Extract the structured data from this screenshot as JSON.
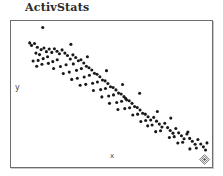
{
  "window": {
    "title": "ActivStats"
  },
  "plot": {
    "y_axis_label": "y",
    "x_axis_label": "x",
    "resize_grip_icon": "diamond-resize-grip-icon",
    "frame_color": "#6d6d6d",
    "point_color": "#1a1a1a",
    "background_color": "#ffffff"
  },
  "chart_data": {
    "type": "scatter",
    "title": "ActivStats",
    "xlabel": "x",
    "ylabel": "y",
    "grid": false,
    "legend": null,
    "xlim": [
      0,
      100
    ],
    "ylim": [
      0,
      100
    ],
    "series": [
      {
        "name": "observations",
        "marker": "dot",
        "color": "#1a1a1a",
        "points": [
          [
            15.8,
            95.5
          ],
          [
            9.3,
            85.0
          ],
          [
            10.2,
            83.3
          ],
          [
            11.7,
            84.6
          ],
          [
            13.1,
            82.0
          ],
          [
            15.0,
            80.4
          ],
          [
            16.4,
            81.5
          ],
          [
            17.6,
            79.0
          ],
          [
            12.4,
            78.0
          ],
          [
            14.2,
            77.0
          ],
          [
            19.0,
            80.8
          ],
          [
            20.3,
            78.5
          ],
          [
            21.6,
            81.0
          ],
          [
            22.9,
            79.3
          ],
          [
            24.1,
            77.6
          ],
          [
            18.2,
            75.5
          ],
          [
            16.0,
            74.2
          ],
          [
            13.5,
            73.0
          ],
          [
            11.0,
            72.6
          ],
          [
            25.4,
            80.2
          ],
          [
            26.8,
            78.0
          ],
          [
            28.1,
            76.4
          ],
          [
            29.5,
            74.0
          ],
          [
            23.0,
            73.5
          ],
          [
            20.8,
            72.2
          ],
          [
            18.6,
            71.0
          ],
          [
            15.4,
            70.4
          ],
          [
            12.8,
            69.0
          ],
          [
            30.8,
            76.8
          ],
          [
            32.2,
            75.0
          ],
          [
            33.5,
            72.8
          ],
          [
            31.0,
            70.6
          ],
          [
            27.4,
            70.0
          ],
          [
            24.6,
            68.8
          ],
          [
            21.2,
            67.5
          ],
          [
            34.8,
            73.5
          ],
          [
            36.2,
            71.2
          ],
          [
            37.5,
            69.0
          ],
          [
            35.0,
            67.4
          ],
          [
            32.6,
            66.2
          ],
          [
            29.0,
            65.0
          ],
          [
            26.0,
            64.0
          ],
          [
            38.8,
            68.0
          ],
          [
            40.2,
            66.4
          ],
          [
            41.5,
            64.2
          ],
          [
            39.0,
            62.8
          ],
          [
            36.4,
            61.6
          ],
          [
            33.0,
            60.8
          ],
          [
            30.2,
            60.0
          ],
          [
            42.8,
            63.5
          ],
          [
            44.2,
            61.8
          ],
          [
            45.5,
            59.6
          ],
          [
            43.0,
            58.2
          ],
          [
            40.6,
            57.4
          ],
          [
            37.2,
            56.6
          ],
          [
            34.4,
            56.0
          ],
          [
            46.8,
            59.0
          ],
          [
            48.2,
            57.2
          ],
          [
            49.5,
            55.0
          ],
          [
            47.0,
            53.8
          ],
          [
            44.6,
            53.0
          ],
          [
            41.0,
            52.4
          ],
          [
            50.8,
            54.5
          ],
          [
            52.2,
            52.8
          ],
          [
            53.5,
            50.6
          ],
          [
            51.0,
            49.4
          ],
          [
            48.6,
            48.6
          ],
          [
            45.2,
            48.0
          ],
          [
            54.8,
            50.0
          ],
          [
            56.2,
            48.2
          ],
          [
            57.5,
            46.0
          ],
          [
            55.0,
            45.0
          ],
          [
            52.6,
            44.2
          ],
          [
            49.0,
            43.6
          ],
          [
            58.8,
            45.4
          ],
          [
            60.2,
            43.6
          ],
          [
            61.5,
            41.4
          ],
          [
            59.0,
            40.6
          ],
          [
            56.6,
            40.0
          ],
          [
            53.2,
            39.4
          ],
          [
            62.8,
            40.8
          ],
          [
            64.2,
            39.0
          ],
          [
            65.5,
            36.8
          ],
          [
            63.0,
            36.2
          ],
          [
            60.6,
            35.6
          ],
          [
            57.0,
            47.0
          ],
          [
            66.8,
            36.2
          ],
          [
            68.2,
            34.4
          ],
          [
            69.5,
            32.2
          ],
          [
            67.0,
            31.8
          ],
          [
            64.6,
            31.2
          ],
          [
            71.0,
            34.0
          ],
          [
            72.4,
            31.4
          ],
          [
            73.8,
            29.4
          ],
          [
            75.1,
            27.4
          ],
          [
            70.2,
            28.8
          ],
          [
            68.0,
            28.2
          ],
          [
            76.5,
            30.0
          ],
          [
            77.9,
            27.0
          ],
          [
            79.2,
            25.0
          ],
          [
            80.6,
            23.2
          ],
          [
            74.4,
            24.8
          ],
          [
            72.0,
            24.2
          ],
          [
            82.0,
            26.4
          ],
          [
            83.4,
            23.4
          ],
          [
            84.8,
            21.4
          ],
          [
            86.1,
            19.4
          ],
          [
            81.2,
            20.8
          ],
          [
            78.8,
            20.2
          ],
          [
            87.5,
            22.6
          ],
          [
            88.9,
            19.6
          ],
          [
            90.2,
            17.6
          ],
          [
            91.6,
            15.6
          ],
          [
            85.4,
            17.0
          ],
          [
            83.0,
            16.4
          ],
          [
            93.0,
            18.8
          ],
          [
            94.4,
            15.8
          ],
          [
            95.7,
            13.8
          ],
          [
            92.2,
            13.0
          ],
          [
            89.0,
            12.4
          ],
          [
            96.8,
            11.6
          ],
          [
            97.5,
            16.5
          ],
          [
            88.0,
            24.0
          ],
          [
            79.5,
            33.5
          ],
          [
            72.8,
            38.0
          ],
          [
            64.0,
            50.5
          ],
          [
            55.5,
            56.5
          ],
          [
            47.5,
            66.0
          ],
          [
            38.0,
            75.5
          ],
          [
            29.8,
            84.0
          ]
        ]
      }
    ]
  }
}
